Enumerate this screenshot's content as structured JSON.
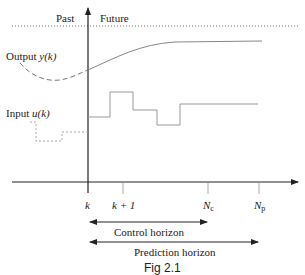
{
  "labels": {
    "past": "Past",
    "future": "Future",
    "output_prefix": "Output ",
    "output_var": "y",
    "output_arg": "(k)",
    "input_prefix": "Input ",
    "input_var": "u",
    "input_arg": "(k)",
    "tick_k": "k",
    "tick_k1": "k + 1",
    "tick_nc_main": "N",
    "tick_nc_sub": "c",
    "tick_np_main": "N",
    "tick_np_sub": "p",
    "control_horizon": "Control horizon",
    "prediction_horizon": "Prediction horizon",
    "caption": "Fig 2.1"
  },
  "colors": {
    "axis": "#222222",
    "signal": "#888888",
    "dotted": "#777777",
    "text": "#222222"
  }
}
